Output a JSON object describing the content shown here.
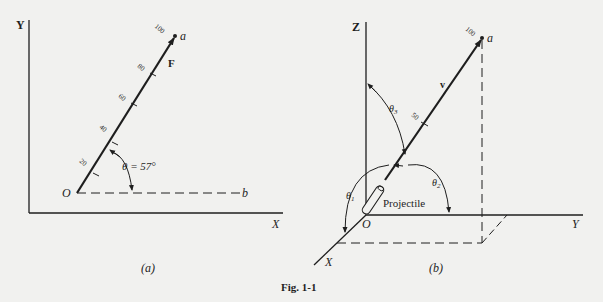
{
  "figure": {
    "caption": "Fig. 1-1",
    "colors": {
      "ink": "#1e1e1e",
      "paper": "#f1f1ef"
    }
  },
  "panel_a": {
    "label": "(a)",
    "axis_y_label": "Y",
    "axis_x_label": "X",
    "origin_label": "O",
    "tip_label": "a",
    "ref_label": "b",
    "vector_label": "F",
    "angle_label": "θ = 57°",
    "ticks": [
      "20",
      "40",
      "60",
      "80",
      "100"
    ]
  },
  "panel_b": {
    "label": "(b)",
    "axis_z_label": "Z",
    "axis_y_label": "Y",
    "axis_x_label": "X",
    "origin_label": "O",
    "tip_label": "a",
    "vector_label": "v",
    "projectile_label": "Projectile",
    "theta1": "θ",
    "theta1_sub": "1",
    "theta2": "θ",
    "theta2_sub": "2",
    "theta3": "θ",
    "theta3_sub": "3",
    "ticks": [
      "50",
      "100"
    ]
  }
}
